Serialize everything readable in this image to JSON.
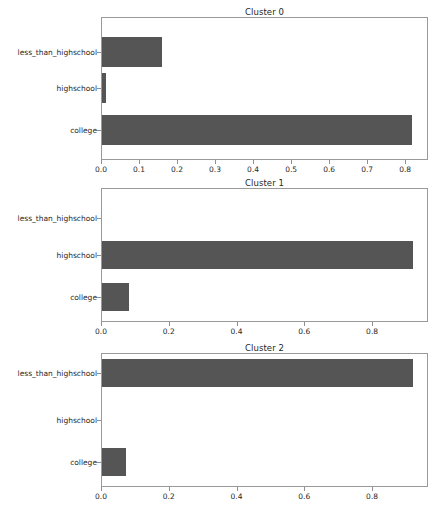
{
  "figure": {
    "background_color": "#ffffff",
    "bar_color": "#555555",
    "axis_color": "#9a9a9a",
    "text_color": "#262626",
    "width": 443,
    "height": 511
  },
  "chart_data": {
    "type": "bar",
    "orientation": "horizontal",
    "title": "",
    "xlabel": "",
    "ylabel": "",
    "grid": false,
    "legend": false,
    "categories": [
      "less_than_highschool",
      "highschool",
      "college"
    ],
    "panels": [
      {
        "title": "Cluster 0",
        "categories": [
          "less_than_highschool",
          "highschool",
          "college"
        ],
        "values": [
          0.16,
          0.013,
          0.817
        ],
        "xlim": [
          0.0,
          0.86
        ],
        "xticks": [
          0.0,
          0.1,
          0.2,
          0.3,
          0.4,
          0.5,
          0.6,
          0.7,
          0.8
        ],
        "xticklabels": [
          "0.0",
          "0.1",
          "0.2",
          "0.3",
          "0.4",
          "0.5",
          "0.6",
          "0.7",
          "0.8"
        ]
      },
      {
        "title": "Cluster 1",
        "categories": [
          "less_than_highschool",
          "highschool",
          "college"
        ],
        "values": [
          0.0,
          0.92,
          0.083
        ],
        "xlim": [
          0.0,
          0.965
        ],
        "xticks": [
          0.0,
          0.2,
          0.4,
          0.6,
          0.8
        ],
        "xticklabels": [
          "0.0",
          "0.2",
          "0.4",
          "0.6",
          "0.8"
        ]
      },
      {
        "title": "Cluster 2",
        "categories": [
          "less_than_highschool",
          "highschool",
          "college"
        ],
        "values": [
          0.92,
          0.0,
          0.073
        ],
        "xlim": [
          0.0,
          0.965
        ],
        "xticks": [
          0.0,
          0.2,
          0.4,
          0.6,
          0.8
        ],
        "xticklabels": [
          "0.0",
          "0.2",
          "0.4",
          "0.6",
          "0.8"
        ]
      }
    ]
  },
  "geometry": {
    "plot_left": 101,
    "plot_width": 327,
    "panels": [
      {
        "title_top": 7,
        "axes_top": 17,
        "axes_height": 143,
        "bar_height": 30,
        "row_centers": [
          52,
          88,
          130
        ]
      },
      {
        "title_top": 178,
        "axes_top": 188,
        "axes_height": 134,
        "bar_height": 28,
        "row_centers": [
          218,
          255,
          297
        ]
      },
      {
        "title_top": 343,
        "axes_top": 353,
        "axes_height": 134,
        "bar_height": 28,
        "row_centers": [
          373,
          420,
          462
        ]
      }
    ]
  }
}
